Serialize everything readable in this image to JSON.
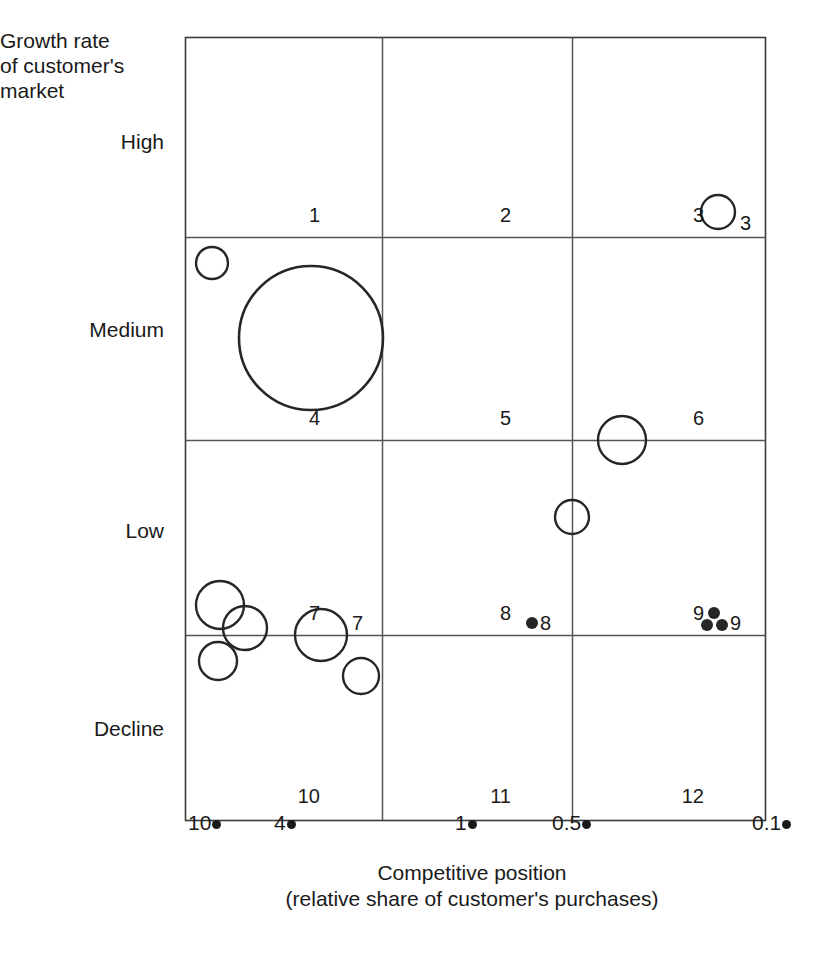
{
  "chart_data": {
    "type": "scatter",
    "title": "",
    "ylabel": "Growth rate\nof customer's\nmarket",
    "xlabel": "Competitive position\n(relative share of customer's purchases)",
    "y_tick_labels": [
      "High",
      "Medium",
      "Low",
      "Decline"
    ],
    "x_tick_labels": [
      "10",
      "4",
      "1",
      "0.5",
      "0.1"
    ],
    "x_axis_direction": "decreasing",
    "grid": true,
    "legend": "none",
    "cell_labels": [
      "1",
      "2",
      "3",
      "4",
      "5",
      "6",
      "7",
      "8",
      "9",
      "10",
      "11",
      "12"
    ],
    "grid_rows": 4,
    "grid_cols": 3,
    "bubbles": [
      {
        "id": "b1",
        "cell": 4,
        "x_share": 11.0,
        "y_band": "Medium",
        "size": "small",
        "marker": "open-circle",
        "px": 212,
        "py": 263,
        "r": 16
      },
      {
        "id": "b2",
        "cell": 4,
        "x_share": 5.5,
        "y_band": "Medium",
        "size": "very-large",
        "marker": "open-circle",
        "px": 311,
        "py": 338,
        "r": 72
      },
      {
        "id": "b3",
        "cell": 3,
        "x_share": 0.13,
        "y_band": "High",
        "size": "small",
        "marker": "open-circle",
        "px": 718,
        "py": 212,
        "r": 17
      },
      {
        "id": "b4",
        "cell": 6,
        "x_share": 0.42,
        "y_band": "Medium",
        "size": "medium",
        "marker": "open-circle",
        "px": 622,
        "py": 440,
        "r": 24
      },
      {
        "id": "b5",
        "cell": 8,
        "x_share": 0.5,
        "y_band": "Low",
        "size": "small",
        "marker": "open-circle",
        "px": 572,
        "py": 517,
        "r": 17
      },
      {
        "id": "b6",
        "cell": 7,
        "x_share": 9.0,
        "y_band": "Low",
        "size": "medium",
        "marker": "open-circle",
        "px": 220,
        "py": 605,
        "r": 24
      },
      {
        "id": "b7",
        "cell": 7,
        "x_share": 7.5,
        "y_band": "Low",
        "size": "medium",
        "marker": "open-circle",
        "px": 245,
        "py": 628,
        "r": 22
      },
      {
        "id": "b8",
        "cell": 10,
        "x_share": 9.2,
        "y_band": "Decline",
        "size": "small",
        "marker": "open-circle",
        "px": 218,
        "py": 661,
        "r": 19
      },
      {
        "id": "b9",
        "cell": 7,
        "x_share": 4.0,
        "y_band": "Low",
        "size": "medium",
        "marker": "open-circle",
        "px": 321,
        "py": 635,
        "r": 26
      },
      {
        "id": "b10",
        "cell": 10,
        "x_share": 3.0,
        "y_band": "Decline",
        "size": "small",
        "marker": "open-circle",
        "px": 361,
        "py": 676,
        "r": 18
      },
      {
        "id": "b11",
        "cell": 8,
        "x_share": 0.72,
        "y_band": "Low",
        "size": "tiny",
        "marker": "filled-dot",
        "px": 532,
        "py": 623,
        "r": 6
      },
      {
        "id": "b12",
        "cell": 9,
        "x_share": 0.16,
        "y_band": "Low",
        "size": "tiny",
        "marker": "filled-dot",
        "px": 714,
        "py": 613,
        "r": 6
      },
      {
        "id": "b13",
        "cell": 9,
        "x_share": 0.17,
        "y_band": "Low",
        "size": "tiny",
        "marker": "filled-dot",
        "px": 707,
        "py": 625,
        "r": 6
      },
      {
        "id": "b14",
        "cell": 9,
        "x_share": 0.15,
        "y_band": "Low",
        "size": "tiny",
        "marker": "filled-dot",
        "px": 722,
        "py": 625,
        "r": 6
      }
    ],
    "bubble_value_labels": [
      {
        "text": "3",
        "px": 740,
        "py": 213
      },
      {
        "text": "7",
        "px": 352,
        "py": 613
      },
      {
        "text": "8",
        "px": 540,
        "py": 613
      },
      {
        "text": "9",
        "px": 730,
        "py": 613
      }
    ],
    "axis_ranges": {
      "x": [
        "10",
        "0.1"
      ],
      "y": [
        "Decline",
        "High"
      ]
    }
  },
  "axes": {
    "y_title": "Growth rate\nof customer's\nmarket",
    "y_ticks": {
      "high": "High",
      "medium": "Medium",
      "low": "Low",
      "decline": "Decline"
    },
    "x_title": "Competitive position\n(relative share of customer's purchases)",
    "x_ticks": [
      {
        "label": "10",
        "px": 188
      },
      {
        "label": "4",
        "px": 274
      },
      {
        "label": "1",
        "px": 455
      },
      {
        "label": "0.5",
        "px": 552
      },
      {
        "label": "0.1",
        "px": 752
      }
    ]
  },
  "grid_cells": [
    {
      "label": "1",
      "px": 320,
      "py": 205
    },
    {
      "label": "2",
      "px": 511,
      "py": 205
    },
    {
      "label": "3",
      "px": 704,
      "py": 205
    },
    {
      "label": "4",
      "px": 320,
      "py": 408
    },
    {
      "label": "5",
      "px": 511,
      "py": 408
    },
    {
      "label": "6",
      "px": 704,
      "py": 408
    },
    {
      "label": "7",
      "px": 320,
      "py": 603
    },
    {
      "label": "8",
      "px": 511,
      "py": 603
    },
    {
      "label": "9",
      "px": 704,
      "py": 603
    },
    {
      "label": "10",
      "px": 320,
      "py": 786
    },
    {
      "label": "11",
      "px": 511,
      "py": 786
    },
    {
      "label": "12",
      "px": 704,
      "py": 786
    }
  ],
  "style": {
    "line_color": "#555555",
    "frame_color": "#3a3a3a",
    "bubble_stroke": "#262626",
    "text_color": "#1a1a1a"
  }
}
